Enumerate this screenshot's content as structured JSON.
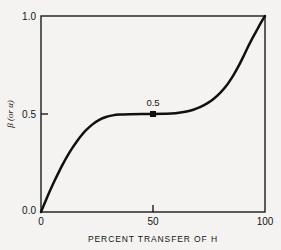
{
  "chart_data": {
    "type": "line",
    "title": "",
    "xlabel": "PERCENT TRANSFER OF H",
    "ylabel": "β (or α)",
    "xlim": [
      0,
      100
    ],
    "ylim": [
      0.0,
      1.0
    ],
    "xticks": [
      0,
      50,
      100
    ],
    "xtick_labels": [
      "0",
      "50",
      "100"
    ],
    "yticks": [
      0.0,
      0.5,
      1.0
    ],
    "ytick_labels": [
      "0.0",
      "0.5",
      "1.0"
    ],
    "grid": false,
    "legend": null,
    "series": [
      {
        "name": "beta",
        "x": [
          0,
          2,
          4,
          6,
          8,
          10,
          12,
          14,
          16,
          18,
          20,
          23,
          26,
          29,
          32,
          35,
          40,
          45,
          50,
          55,
          60,
          65,
          68,
          71,
          74,
          77,
          80,
          83,
          86,
          88,
          90,
          92,
          94,
          96,
          98,
          100
        ],
        "values": [
          0.0,
          0.055,
          0.108,
          0.158,
          0.205,
          0.249,
          0.29,
          0.327,
          0.36,
          0.39,
          0.416,
          0.447,
          0.47,
          0.485,
          0.493,
          0.497,
          0.499,
          0.5,
          0.5,
          0.501,
          0.504,
          0.513,
          0.522,
          0.535,
          0.553,
          0.577,
          0.608,
          0.648,
          0.7,
          0.74,
          0.785,
          0.833,
          0.878,
          0.92,
          0.962,
          1.0
        ]
      }
    ],
    "annotations": [
      {
        "name": "midpoint",
        "label": "0.5",
        "x": 50,
        "y": 0.5,
        "marker": "filled-square"
      }
    ]
  }
}
